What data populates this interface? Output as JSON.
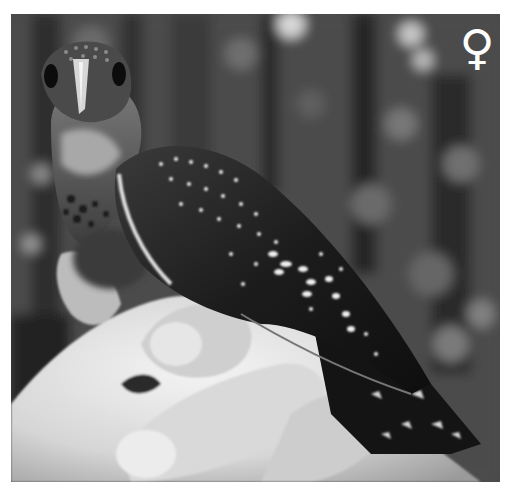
{
  "image": {
    "description": "Grayscale photo of a spotted kingfisher-like bird held in a human hand against a blurred forest background",
    "tone": "grayscale",
    "colors": {
      "background": "#ffffff",
      "photo_dark": "#1a1a1a",
      "photo_mid": "#5a5a5a",
      "skin": "#d8d8d8",
      "highlight": "#f2f2f2"
    }
  },
  "overlay": {
    "sex_symbol": "♀",
    "sex_symbol_icon": "female-symbol-icon"
  }
}
